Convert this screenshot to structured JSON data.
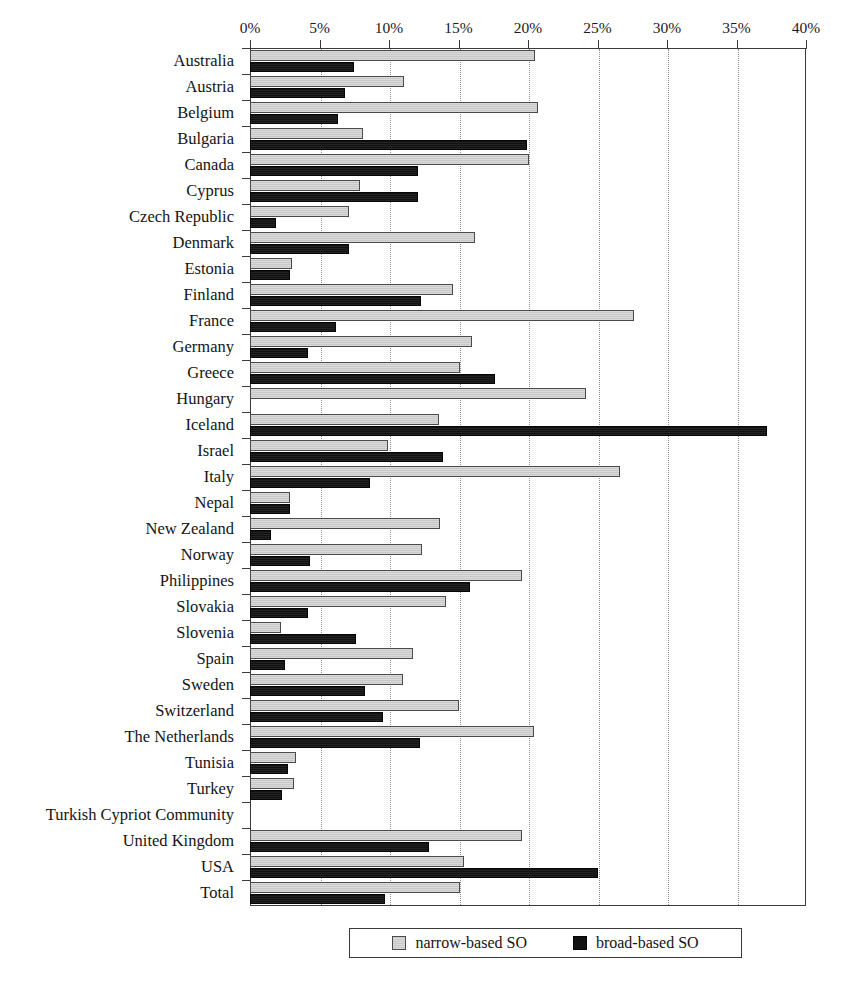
{
  "chart_data": {
    "type": "bar",
    "orientation": "horizontal",
    "title": "",
    "subtitle": "",
    "xlabel": "",
    "ylabel": "",
    "xlim": [
      0,
      40
    ],
    "xunit": "%",
    "grid": true,
    "grid_axis": "x",
    "legend_position": "bottom",
    "xticks": [
      "0%",
      "5%",
      "10%",
      "15%",
      "20%",
      "25%",
      "30%",
      "35%",
      "40%"
    ],
    "xtick_values": [
      0,
      5,
      10,
      15,
      20,
      25,
      30,
      35,
      40
    ],
    "categories": [
      "Australia",
      "Austria",
      "Belgium",
      "Bulgaria",
      "Canada",
      "Cyprus",
      "Czech Republic",
      "Denmark",
      "Estonia",
      "Finland",
      "France",
      "Germany",
      "Greece",
      "Hungary",
      "Iceland",
      "Israel",
      "Italy",
      "Nepal",
      "New Zealand",
      "Norway",
      "Philippines",
      "Slovakia",
      "Slovenia",
      "Spain",
      "Sweden",
      "Switzerland",
      "The Netherlands",
      "Tunisia",
      "Turkey",
      "Turkish Cypriot Community",
      "United Kingdom",
      "USA",
      "Total"
    ],
    "series": [
      {
        "name": "narrow-based SO",
        "color": "#c9c9c9",
        "values": [
          20.5,
          11.1,
          20.7,
          8.1,
          20.1,
          7.9,
          7.1,
          16.2,
          3.0,
          14.6,
          27.6,
          16.0,
          15.1,
          24.2,
          13.6,
          9.9,
          26.6,
          2.9,
          13.7,
          12.4,
          19.6,
          14.1,
          2.2,
          11.7,
          11.0,
          15.0,
          20.4,
          3.3,
          3.2,
          0.0,
          19.6,
          15.4,
          15.1
        ]
      },
      {
        "name": "broad-based SO",
        "color": "#121212",
        "values": [
          7.5,
          6.8,
          6.3,
          19.9,
          12.1,
          12.1,
          1.9,
          7.1,
          2.9,
          12.3,
          6.2,
          4.2,
          17.6,
          0.0,
          37.2,
          13.9,
          8.6,
          2.9,
          1.5,
          4.3,
          15.8,
          4.2,
          7.6,
          2.5,
          8.3,
          9.6,
          12.2,
          2.7,
          2.3,
          0.0,
          12.9,
          25.0,
          9.7
        ]
      }
    ]
  },
  "legend": {
    "items": [
      {
        "label": "narrow-based SO",
        "style": "narrow"
      },
      {
        "label": "broad-based SO",
        "style": "broad"
      }
    ]
  },
  "colors": {
    "narrow_fill": "#c9c9c9",
    "broad_fill": "#121212",
    "axis": "#3a3a3a",
    "grid": "#8c8c8c",
    "background": "#ffffff",
    "text": "#141414"
  }
}
